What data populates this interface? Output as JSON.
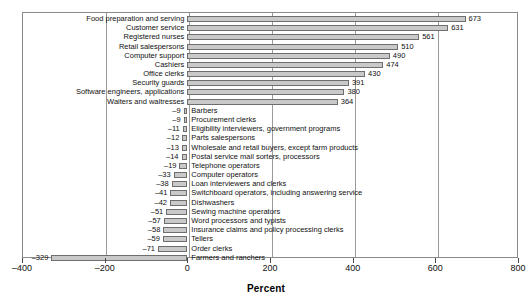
{
  "chart_data": {
    "type": "bar",
    "orientation": "horizontal",
    "title": "",
    "subtitle": "",
    "xlabel": "Percent",
    "ylabel": "",
    "xlim": [
      -400,
      800
    ],
    "xticks": [
      -400,
      -200,
      0,
      200,
      400,
      600,
      800
    ],
    "xticklabels": [
      "–400",
      "–200",
      "0",
      "200",
      "400",
      "600",
      "800"
    ],
    "grid": "vertical-major",
    "legend": "none",
    "bar_color": "#c9c9c9",
    "bar_edge_color": "#6e6e6e",
    "categories": [
      "Food preparation and serving",
      "Customer service",
      "Registered nurses",
      "Retail salespersons",
      "Computer support",
      "Cashiers",
      "Office clerks",
      "Security guards",
      "Software engineers, applications",
      "Waiters and waitresses",
      "Barbers",
      "Procurement clerks",
      "Eligibility interviewers, government programs",
      "Parts salespersons",
      "Wholesale and retail buyers, except farm products",
      "Postal service mail sorters, processors",
      "Telephone operators",
      "Computer operators",
      "Loan interviewers and clerks",
      "Switchboard operators, including answering service",
      "Dishwashers",
      "Sewing machine operators",
      "Word processors and typists",
      "Insurance claims and policy processing clerks",
      "Tellers",
      "Order clerks",
      "Farmers and ranchers"
    ],
    "values": [
      673,
      631,
      561,
      510,
      490,
      474,
      430,
      391,
      380,
      364,
      -9,
      -9,
      -11,
      -12,
      -13,
      -14,
      -19,
      -33,
      -38,
      -41,
      -42,
      -51,
      -57,
      -58,
      -59,
      -71,
      -329
    ],
    "value_labels": [
      "673",
      "631",
      "561",
      "510",
      "490",
      "474",
      "430",
      "391",
      "380",
      "364",
      "–9",
      "–9",
      "–11",
      "–12",
      "–13",
      "–14",
      "–19",
      "–33",
      "–38",
      "–41",
      "–42",
      "–51",
      "–57",
      "–58",
      "–59",
      "–71",
      "–329"
    ],
    "label_placement": [
      "left-of-axis",
      "left-of-axis",
      "left-of-axis",
      "left-of-axis",
      "left-of-axis",
      "left-of-axis",
      "left-of-axis",
      "left-of-axis",
      "left-of-axis",
      "left-of-axis",
      "right-of-axis",
      "right-of-axis",
      "right-of-axis",
      "right-of-axis",
      "right-of-axis",
      "right-of-axis",
      "right-of-axis",
      "right-of-axis",
      "right-of-axis",
      "right-of-axis",
      "right-of-axis",
      "right-of-axis",
      "right-of-axis",
      "right-of-axis",
      "right-of-axis",
      "right-of-axis",
      "right-of-axis"
    ]
  }
}
